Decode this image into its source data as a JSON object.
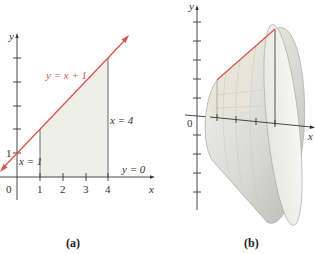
{
  "panel_a": {
    "caption": "(a)",
    "axis_x_label": "x",
    "axis_y_label": "y",
    "origin_label": "0",
    "y_tick_label": "1",
    "x_tick_labels": [
      "1",
      "2",
      "3",
      "4"
    ],
    "line_label": "y = x + 1",
    "left_bound_label": "x = 1",
    "right_bound_label": "x = 4",
    "bottom_bound_label": "y = 0",
    "line_color": "#d9534f",
    "region_fill": "#eef0e8"
  },
  "panel_b": {
    "caption": "(b)",
    "axis_x_label": "x",
    "axis_y_label": "y",
    "origin_label": "0",
    "description": "Solid of revolution (frustum) obtained by rotating the region about the x-axis"
  }
}
